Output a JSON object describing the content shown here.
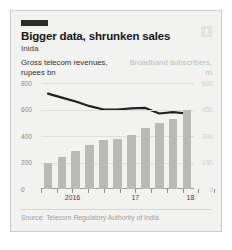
{
  "card": {
    "badge_label": "1",
    "headline": "Bigger data, shrunken sales",
    "subhead": "Inida",
    "source": "Source: Telecom Regulatory Authority of India",
    "accent_color": "#2b2b2b",
    "bar_color": "#b9b9b7",
    "line_color": "#1f1f1f",
    "background_color": "#f2f2f0"
  },
  "chart_data": {
    "type": "bar",
    "title": "Bigger data, shrunken sales",
    "subtitle": "Inida",
    "xlabel": "",
    "ylabel": "Gross telecom revenues, rupees bn",
    "y2label": "Broadband subscribers, m",
    "grid": true,
    "legend_position": "none",
    "ylim": [
      0,
      800
    ],
    "y2lim": [
      0,
      600
    ],
    "yticks": [
      "0",
      "200",
      "400",
      "600",
      "800"
    ],
    "y2ticks": [
      "0",
      "150",
      "300",
      "450",
      "600"
    ],
    "xticks": [
      "2016",
      "17",
      "18"
    ],
    "categories": [
      "2016 Q1",
      "2016 Q2",
      "2016 Q3",
      "2016 Q4",
      "2017 Q1",
      "2017 Q2",
      "2017 Q3",
      "2017 Q4",
      "2018 Q1",
      "2018 Q2",
      "2018 Q3"
    ],
    "series": [
      {
        "name": "Broadband subscribers, m",
        "axis": "right",
        "render": "bar",
        "color": "#b9b9b7",
        "values": [
          150,
          180,
          215,
          250,
          275,
          285,
          305,
          345,
          375,
          395,
          445
        ]
      },
      {
        "name": "Gross telecom revenues, rupees bn",
        "axis": "left",
        "render": "line",
        "color": "#1f1f1f",
        "values": [
          720,
          690,
          660,
          625,
          600,
          600,
          608,
          612,
          570,
          580,
          570
        ]
      }
    ]
  }
}
